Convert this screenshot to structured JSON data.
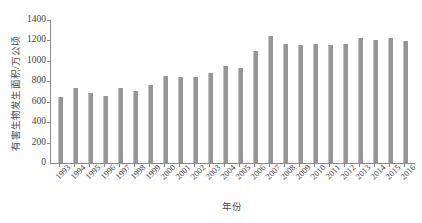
{
  "chart_data": {
    "type": "bar",
    "title": "",
    "xlabel": "年份",
    "ylabel": "有害生物发生面积/万公顷",
    "ylim": [
      0,
      1400
    ],
    "ytick_step": 200,
    "yticks": [
      1400,
      1200,
      1000,
      800,
      600,
      400,
      200,
      0
    ],
    "ytick_labels": [
      "1400",
      "1200",
      "1000",
      "800",
      "600",
      "400",
      "200",
      "0"
    ],
    "grid": false,
    "legend": null,
    "bar_color": "#969696",
    "axis_color": "#8a8a8a",
    "categories": [
      "1993",
      "1994",
      "1995",
      "1996",
      "1997",
      "1998",
      "1999",
      "2000",
      "2001",
      "2002",
      "2003",
      "2004",
      "2005",
      "2006",
      "2007",
      "2008",
      "2009",
      "2010",
      "2011",
      "2012",
      "2013",
      "2014",
      "2015",
      "2016"
    ],
    "values": [
      650,
      730,
      685,
      660,
      730,
      705,
      765,
      855,
      840,
      845,
      885,
      950,
      935,
      1100,
      1240,
      1165,
      1155,
      1165,
      1160,
      1165,
      1225,
      1200,
      1220,
      1190
    ]
  }
}
